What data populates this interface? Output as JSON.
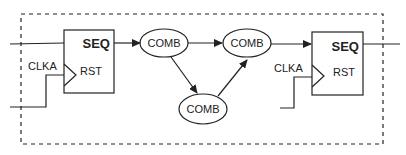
{
  "diagram": {
    "boundary": "dashed-clock-domain",
    "registers": [
      {
        "id": "seq_left",
        "title": "SEQ",
        "reset_label": "RST",
        "clock_label": "CLKA"
      },
      {
        "id": "seq_right",
        "title": "SEQ",
        "reset_label": "RST",
        "clock_label": "CLKA"
      }
    ],
    "comb_nodes": [
      {
        "id": "comb1",
        "label": "COMB"
      },
      {
        "id": "comb2",
        "label": "COMB"
      },
      {
        "id": "comb3",
        "label": "COMB"
      }
    ],
    "edges": [
      {
        "from": "seq_left",
        "to": "comb1"
      },
      {
        "from": "comb1",
        "to": "comb2"
      },
      {
        "from": "comb1",
        "to": "comb3"
      },
      {
        "from": "comb3",
        "to": "comb2"
      },
      {
        "from": "comb2",
        "to": "seq_right"
      }
    ],
    "colors": {
      "stroke": "#222222",
      "background": "#ffffff"
    }
  }
}
